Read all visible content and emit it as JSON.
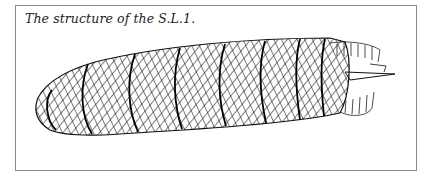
{
  "figure": {
    "caption": "The structure of the S.L.1.",
    "illustration": "airship-lattice-structure",
    "colors": {
      "ink": "#111111",
      "border": "#8a8a8a",
      "background": "#ffffff"
    }
  }
}
